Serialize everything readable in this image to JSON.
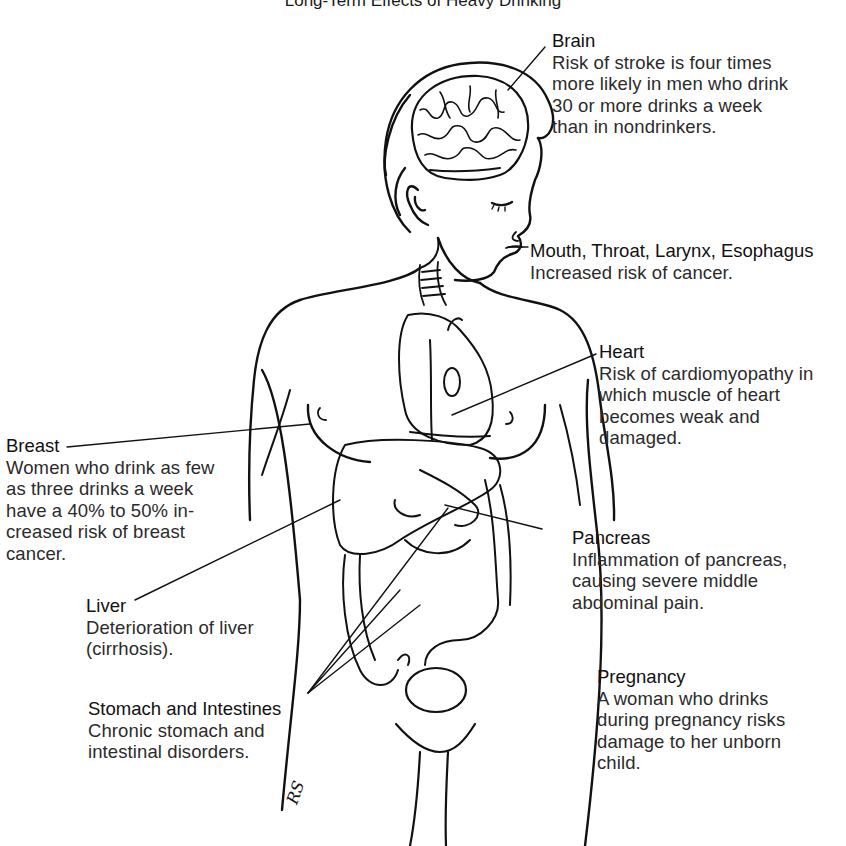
{
  "title": "Long-Term Effects of Heavy Drinking",
  "callouts": {
    "brain": {
      "heading": "Brain",
      "lines": [
        "Risk of stroke is four times",
        "more likely in men who drink",
        "30 or more drinks a week",
        "than in nondrinkers."
      ]
    },
    "mouth": {
      "heading": "Mouth, Throat, Larynx, Esophagus",
      "lines": [
        "Increased risk of cancer."
      ]
    },
    "heart": {
      "heading": "Heart",
      "lines": [
        "Risk of cardiomyopathy in",
        "which muscle of heart",
        "becomes  weak and",
        "damaged."
      ]
    },
    "breast": {
      "heading": "Breast",
      "lines": [
        "Women who drink as few",
        "as three drinks a week",
        "have a 40% to 50% in-",
        "creased risk of breast",
        "cancer."
      ]
    },
    "pancreas": {
      "heading": "Pancreas",
      "lines": [
        "Inflammation of pancreas,",
        "causing severe middle",
        "abdominal pain."
      ]
    },
    "liver": {
      "heading": "Liver",
      "lines": [
        "Deterioration of liver",
        "(cirrhosis)."
      ]
    },
    "pregnancy": {
      "heading": "Pregnancy",
      "lines": [
        "A woman who drinks",
        "during pregnancy risks",
        "damage to her unborn",
        "child."
      ]
    },
    "stomach": {
      "heading": "Stomach and Intestines",
      "lines": [
        "Chronic stomach and",
        "intestinal disorders."
      ]
    }
  },
  "artist_signature": "RS",
  "colors": {
    "ink": "#111111",
    "text": "#2b2b2b",
    "background": "#ffffff"
  }
}
